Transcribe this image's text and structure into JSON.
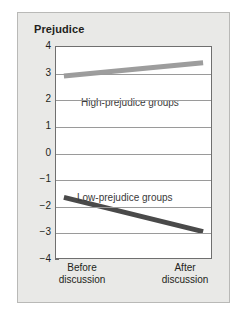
{
  "chart_data": {
    "type": "line",
    "title": "Prejudice",
    "xlabel": "",
    "ylabel": "Prejudice",
    "categories": [
      "Before discussion",
      "After discussion"
    ],
    "category_lines": [
      [
        "Before",
        "discussion"
      ],
      [
        "After",
        "discussion"
      ]
    ],
    "ylim": [
      -4,
      4
    ],
    "yticks": [
      4,
      3,
      2,
      1,
      0,
      "−1",
      "−2",
      "−3",
      "−4"
    ],
    "ytick_values": [
      4,
      3,
      2,
      1,
      0,
      -1,
      -2,
      -3,
      -4
    ],
    "grid": true,
    "legend_position": "inline-annotation",
    "series": [
      {
        "name": "High-prejudice groups",
        "values": [
          2.9,
          3.4
        ],
        "color": "#9d9d9d",
        "label_text": "High-prejudice groups"
      },
      {
        "name": "Low-prejudice groups",
        "values": [
          -1.7,
          -3.0
        ],
        "color": "#4a4a4a",
        "label_text": "Low-prejudice groups"
      }
    ],
    "colors": {
      "card_background": "#e9e9e7",
      "card_border": "#b9b9b7",
      "plot_background": "#ffffff",
      "axis": "#6f6f6f",
      "gridline": "#9a9a9a",
      "text": "#231f20",
      "high_series": "#9d9d9d",
      "low_series": "#4a4a4a"
    }
  }
}
